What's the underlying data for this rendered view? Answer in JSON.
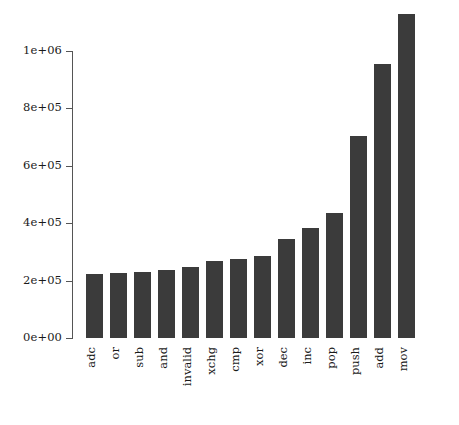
{
  "chart_data": {
    "type": "bar",
    "title": "",
    "subtitle": "",
    "xlabel": "",
    "ylabel": "",
    "categories": [
      "adc",
      "or",
      "sub",
      "and",
      "invalid",
      "xchg",
      "cmp",
      "xor",
      "dec",
      "inc",
      "pop",
      "push",
      "add",
      "mov"
    ],
    "values": [
      223000,
      227000,
      230000,
      237000,
      247000,
      268000,
      275000,
      286000,
      345000,
      383000,
      436000,
      705000,
      955000,
      1129000
    ],
    "series": [
      {
        "name": "instruction count",
        "values": [
          223000,
          227000,
          230000,
          237000,
          247000,
          268000,
          275000,
          286000,
          345000,
          383000,
          436000,
          705000,
          955000,
          1129000
        ]
      }
    ],
    "ylim": [
      0,
      1129000
    ],
    "yticks": [
      0,
      200000,
      400000,
      600000,
      800000,
      1000000
    ],
    "ytick_labels": [
      "0e+00",
      "2e+05",
      "4e+05",
      "6e+05",
      "8e+05",
      "1e+06"
    ],
    "grid": false,
    "legend": null,
    "legend_position": "none",
    "bar_color": "#3b3b3b",
    "axis_color": "#555555",
    "background_color": "#ffffff",
    "x_labels_rotated": true
  }
}
